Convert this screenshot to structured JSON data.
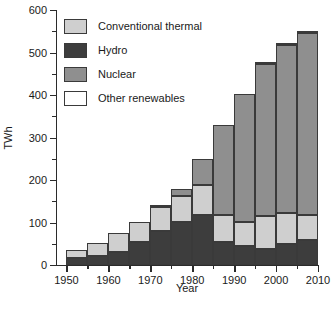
{
  "chart_data": {
    "type": "bar",
    "stacked": true,
    "title": "",
    "xlabel": "Year",
    "ylabel": "TWh",
    "xlim": [
      1947.5,
      2010
    ],
    "ylim": [
      0,
      600
    ],
    "ytick_major_step": 100,
    "ytick_minor_step": 50,
    "xtick_major_step": 10,
    "xtick_minor_step": 5,
    "grid": false,
    "legend_position": "upper left inside",
    "categories": [
      1950,
      1955,
      1960,
      1965,
      1970,
      1975,
      1980,
      1985,
      1990,
      1995,
      2000,
      2005
    ],
    "xtick_labels": [
      "1950",
      "1960",
      "1970",
      "1980",
      "1990",
      "2000",
      "2010"
    ],
    "ytick_labels": [
      "0",
      "100",
      "200",
      "300",
      "400",
      "500",
      "600"
    ],
    "series": [
      {
        "name": "Hydro",
        "color": "#3d3d3d",
        "values": [
          17,
          22,
          31,
          53,
          79,
          102,
          118,
          53,
          45,
          37,
          50,
          60
        ]
      },
      {
        "name": "Conventional thermal",
        "color": "#cfcfcf",
        "values": [
          18,
          30,
          44,
          49,
          58,
          60,
          70,
          65,
          57,
          78,
          72,
          57
        ]
      },
      {
        "name": "Nuclear",
        "color": "#8f8f8f",
        "values": [
          0,
          0,
          0,
          0,
          4,
          17,
          61,
          212,
          300,
          357,
          396,
          429
        ]
      },
      {
        "name": "Other renewables",
        "color": "#ffffff",
        "values": [
          0,
          0,
          0,
          0,
          0,
          0,
          0,
          0,
          0,
          1,
          1,
          1
        ]
      }
    ],
    "totals": [
      35,
      52,
      75,
      102,
      141,
      179,
      249,
      330,
      402,
      473,
      519,
      547
    ]
  },
  "legend": {
    "items": [
      {
        "label": "Conventional thermal",
        "color": "#cfcfcf"
      },
      {
        "label": "Hydro",
        "color": "#3d3d3d"
      },
      {
        "label": "Nuclear",
        "color": "#8f8f8f"
      },
      {
        "label": "Other renewables",
        "color": "#ffffff"
      }
    ]
  }
}
